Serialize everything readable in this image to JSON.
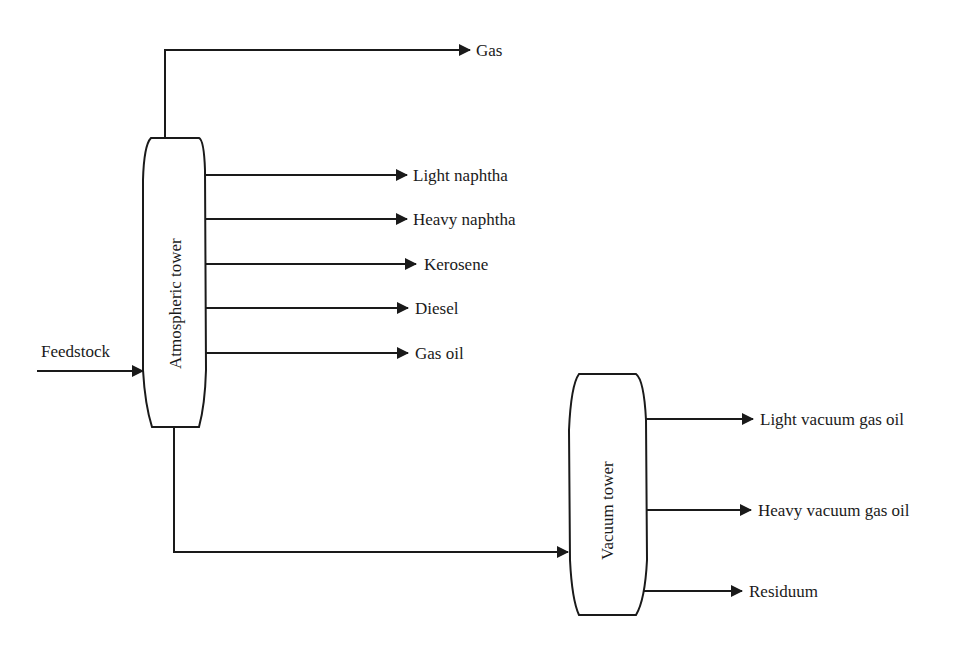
{
  "diagram": {
    "type": "process-flow",
    "colors": {
      "stroke": "#1a1a1a",
      "background": "#ffffff"
    },
    "input": {
      "label": "Feedstock"
    },
    "atmospheric_tower": {
      "label": "Atmospheric tower",
      "outputs": [
        {
          "label": "Gas"
        },
        {
          "label": "Light naphtha"
        },
        {
          "label": "Heavy naphtha"
        },
        {
          "label": "Kerosene"
        },
        {
          "label": "Diesel"
        },
        {
          "label": "Gas oil"
        }
      ]
    },
    "vacuum_tower": {
      "label": "Vacuum tower",
      "outputs": [
        {
          "label": "Light vacuum gas oil"
        },
        {
          "label": "Heavy vacuum gas oil"
        },
        {
          "label": "Residuum"
        }
      ]
    }
  }
}
